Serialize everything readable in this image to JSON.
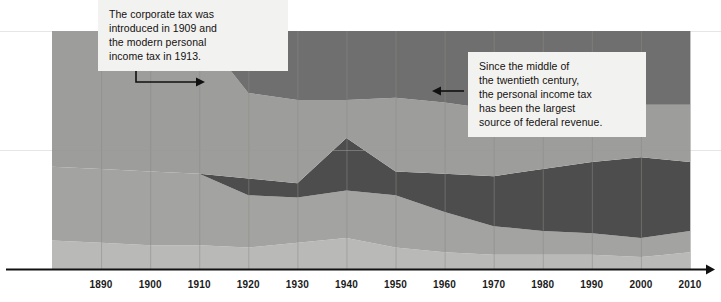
{
  "chart_data": {
    "type": "area",
    "title": "",
    "subtitle": "",
    "xlabel": "",
    "ylabel": "",
    "stacked": true,
    "normalized": true,
    "grid": true,
    "legend_position": "none",
    "xlim": [
      1880,
      2010
    ],
    "ylim": [
      0,
      100
    ],
    "x": [
      1880,
      1890,
      1900,
      1910,
      1920,
      1930,
      1940,
      1950,
      1960,
      1970,
      1980,
      1990,
      2000,
      2010
    ],
    "xticks": [
      1890,
      1900,
      1910,
      1920,
      1930,
      1940,
      1950,
      1960,
      1970,
      1980,
      1990,
      2000,
      2010
    ],
    "ytick_gridlines": [
      50
    ],
    "series": [
      {
        "name": "Other receipts",
        "color": "#b9b9b7",
        "values": [
          12,
          11,
          10,
          10,
          9,
          11,
          13,
          9,
          7,
          6,
          6,
          6,
          5,
          7
        ]
      },
      {
        "name": "Excise and customs duties",
        "color": "#a3a3a1",
        "values": [
          31,
          31,
          31,
          30,
          22,
          19,
          20,
          22,
          17,
          12,
          10,
          9,
          8,
          9
        ]
      },
      {
        "name": "Personal income tax",
        "color": "#4d4d4d",
        "values": [
          0,
          0,
          0,
          0,
          7,
          6,
          22,
          10,
          16,
          21,
          26,
          30,
          34,
          29
        ]
      },
      {
        "name": "Payroll and social insurance taxes",
        "color": "#9d9d9b",
        "values": [
          57,
          58,
          59,
          60,
          36,
          35,
          16,
          31,
          30,
          28,
          26,
          23,
          22,
          24
        ]
      },
      {
        "name": "Corporate income tax",
        "color": "#6f6f6f",
        "values": [
          0,
          0,
          0,
          0,
          26,
          29,
          29,
          28,
          30,
          33,
          32,
          32,
          31,
          31
        ]
      }
    ],
    "annotations": [
      {
        "id": "corporate-tax",
        "text": "The corporate tax was\nintroduced in 1909 and\nthe modern personal\nincome tax in 1913.",
        "arrow": "elbow-right",
        "points_to_x": 1913
      },
      {
        "id": "income-tax",
        "text": "Since the middle of\nthe twentieth century,\nthe personal income tax\nhas been the largest\nsource of federal revenue.",
        "arrow": "left",
        "points_to_x": 1955
      }
    ]
  },
  "axis": {
    "tick_labels": [
      "1890",
      "1900",
      "1910",
      "1920",
      "1930",
      "1940",
      "1950",
      "1960",
      "1970",
      "1980",
      "1990",
      "2000",
      "2010"
    ]
  },
  "colors": {
    "band_lightest": "#b9b9b7",
    "band_light": "#a3a3a1",
    "band_mid": "#9d9d9b",
    "band_medium": "#8f8f8d",
    "band_dark_gray": "#6f6f6f",
    "band_darkest": "#4d4d4d",
    "axis_line": "#111111",
    "gridline": "#d8d8d6",
    "callout_bg": "#f2f2f0",
    "text": "#14110f"
  }
}
